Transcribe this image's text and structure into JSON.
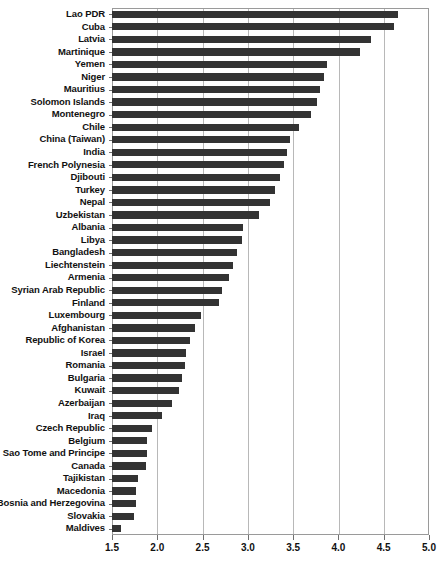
{
  "chart_data": {
    "type": "bar",
    "orientation": "horizontal",
    "title": "",
    "xlabel": "",
    "ylabel": "",
    "xlim": [
      1.5,
      5.0
    ],
    "xticks": [
      "1.5",
      "2.0",
      "2.5",
      "3.0",
      "3.5",
      "4.0",
      "4.5",
      "5.0"
    ],
    "grid": true,
    "legend": "none",
    "bar_color": "#333333",
    "categories": [
      "Lao PDR",
      "Cuba",
      "Latvia",
      "Martinique",
      "Yemen",
      "Niger",
      "Mauritius",
      "Solomon Islands",
      "Montenegro",
      "Chile",
      "China (Taiwan)",
      "India",
      "French Polynesia",
      "Djibouti",
      "Turkey",
      "Nepal",
      "Uzbekistan",
      "Albania",
      "Libya",
      "Bangladesh",
      "Liechtenstein",
      "Armenia",
      "Syrian Arab Republic",
      "Finland",
      "Luxembourg",
      "Afghanistan",
      "Republic of Korea",
      "Israel",
      "Romania",
      "Bulgaria",
      "Kuwait",
      "Azerbaijan",
      "Iraq",
      "Czech Republic",
      "Belgium",
      "Sao Tome and Principe",
      "Canada",
      "Tajikistan",
      "Macedonia",
      "Bosnia and Herzegovina",
      "Slovakia",
      "Maldives"
    ],
    "values": [
      4.66,
      4.61,
      4.36,
      4.24,
      3.87,
      3.84,
      3.8,
      3.76,
      3.7,
      3.57,
      3.47,
      3.43,
      3.4,
      3.36,
      3.3,
      3.24,
      3.12,
      2.95,
      2.93,
      2.88,
      2.84,
      2.79,
      2.72,
      2.68,
      2.48,
      2.42,
      2.36,
      2.32,
      2.31,
      2.27,
      2.24,
      2.16,
      2.05,
      1.94,
      1.89,
      1.89,
      1.87,
      1.79,
      1.77,
      1.77,
      1.74,
      1.6
    ]
  },
  "caption": {
    "text": ""
  }
}
